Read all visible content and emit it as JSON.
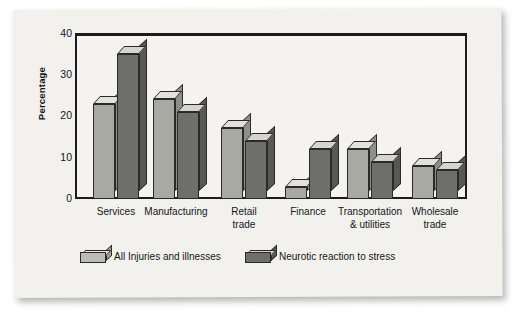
{
  "chart_data": {
    "type": "bar",
    "title": "",
    "xlabel": "",
    "ylabel": "Percentage",
    "ylim": [
      0,
      40
    ],
    "yticks": [
      0,
      10,
      20,
      30,
      40
    ],
    "grid": false,
    "legend_position": "bottom",
    "categories": [
      "Services",
      "Manufacturing",
      "Retail\ntrade",
      "Finance",
      "Transportation\n& utilities",
      "Wholesale\ntrade"
    ],
    "category_lines": [
      [
        "Services"
      ],
      [
        "Manufacturing"
      ],
      [
        "Retail",
        "trade"
      ],
      [
        "Finance"
      ],
      [
        "Transportation",
        "& utilities"
      ],
      [
        "Wholesale",
        "trade"
      ]
    ],
    "series": [
      {
        "name": "All Injuries and illnesses",
        "color": "#a9a9a4",
        "values": [
          23,
          24,
          17,
          3,
          12,
          8
        ]
      },
      {
        "name": "Neurotic reaction to stress",
        "color": "#6e6e6c",
        "values": [
          35,
          21,
          14,
          12,
          9,
          7
        ]
      }
    ]
  },
  "axis": {
    "ytick_labels": [
      "40",
      "30",
      "20",
      "10",
      "0"
    ],
    "ylabel_text": "Percentage"
  },
  "legend": {
    "items": [
      {
        "label": "All Injuries and illnesses",
        "swatch": "light"
      },
      {
        "label": "Neurotic reaction to stress",
        "swatch": "dark"
      }
    ]
  },
  "colors": {
    "page": "#f2f1ed",
    "plot_bg": "#f4f3ef",
    "axis": "#1c1c1c",
    "series_light": "#a9a9a4",
    "series_dark": "#6e6e6c"
  }
}
